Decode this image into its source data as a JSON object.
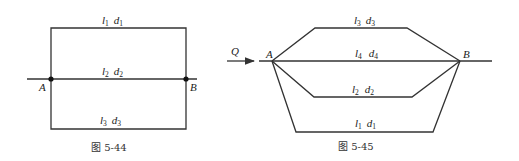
{
  "figures": [
    {
      "caption": "图 5-44",
      "nodes": [
        {
          "label": "A"
        },
        {
          "label": "B"
        }
      ],
      "pipes": [
        {
          "l": "l",
          "l_sub": "1",
          "d": "d",
          "d_sub": "1"
        },
        {
          "l": "l",
          "l_sub": "2",
          "d": "d",
          "d_sub": "2"
        },
        {
          "l": "l",
          "l_sub": "3",
          "d": "d",
          "d_sub": "3"
        }
      ]
    },
    {
      "caption": "图 5-45",
      "flow_label": "Q",
      "nodes": [
        {
          "label": "A"
        },
        {
          "label": "B"
        }
      ],
      "pipes": [
        {
          "l": "l",
          "l_sub": "3",
          "d": "d",
          "d_sub": "3"
        },
        {
          "l": "l",
          "l_sub": "4",
          "d": "d",
          "d_sub": "4"
        },
        {
          "l": "l",
          "l_sub": "2",
          "d": "d",
          "d_sub": "2"
        },
        {
          "l": "l",
          "l_sub": "1",
          "d": "d",
          "d_sub": "1"
        }
      ]
    }
  ],
  "colors": {
    "line": "#333333",
    "text": "#222222",
    "background": "#ffffff"
  }
}
